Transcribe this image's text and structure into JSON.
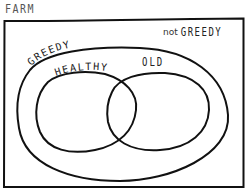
{
  "diagram": {
    "type": "venn",
    "outer_set": {
      "label": "FARM"
    },
    "regions": {
      "complement_label_prefix": "not",
      "complement_label_set": "GREEDY"
    },
    "sets": [
      {
        "id": "greedy",
        "label": "GREEDY"
      },
      {
        "id": "healthy",
        "label": "HEALTHY"
      },
      {
        "id": "old",
        "label": "OLD"
      }
    ],
    "relations": [
      "HEALTHY is a subset of GREEDY",
      "OLD is a subset of GREEDY",
      "HEALTHY and OLD overlap"
    ],
    "colors": {
      "ink": "#111111",
      "background": "#ffffff",
      "label_gray": "#555555"
    }
  }
}
